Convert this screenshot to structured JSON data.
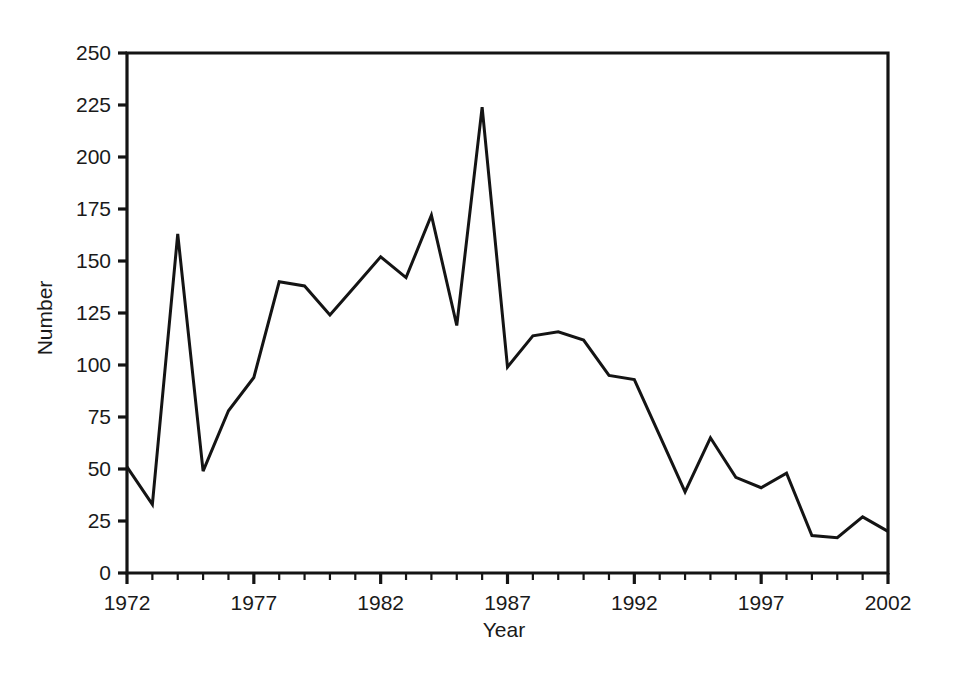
{
  "chart_data": {
    "type": "line",
    "title": "",
    "xlabel": "Year",
    "ylabel": "Number",
    "xlim": [
      1972,
      2002
    ],
    "ylim": [
      0,
      250
    ],
    "grid": false,
    "legend": null,
    "x_tick_labels": [
      "1972",
      "1977",
      "1982",
      "1987",
      "1992",
      "1997",
      "2002"
    ],
    "x_tick_values": [
      1972,
      1977,
      1982,
      1987,
      1992,
      1997,
      2002
    ],
    "x_minor_tick_interval": 1,
    "y_tick_labels": [
      "0",
      "25",
      "50",
      "75",
      "100",
      "125",
      "150",
      "175",
      "200",
      "225",
      "250"
    ],
    "y_tick_values": [
      0,
      25,
      50,
      75,
      100,
      125,
      150,
      175,
      200,
      225,
      250
    ],
    "x": [
      1972,
      1973,
      1974,
      1975,
      1976,
      1977,
      1978,
      1979,
      1980,
      1981,
      1982,
      1983,
      1984,
      1985,
      1986,
      1987,
      1988,
      1989,
      1990,
      1991,
      1992,
      1993,
      1994,
      1995,
      1996,
      1997,
      1998,
      1999,
      2000,
      2001,
      2002
    ],
    "values": [
      51,
      33,
      163,
      49,
      78,
      94,
      140,
      138,
      124,
      138,
      152,
      142,
      172,
      119,
      224,
      99,
      114,
      116,
      112,
      95,
      93,
      66,
      39,
      65,
      46,
      41,
      48,
      18,
      17,
      27,
      20
    ],
    "series": [
      {
        "name": "Number",
        "color": "#141414",
        "values": [
          51,
          33,
          163,
          49,
          78,
          94,
          140,
          138,
          124,
          138,
          152,
          142,
          172,
          119,
          224,
          99,
          114,
          116,
          112,
          95,
          93,
          66,
          39,
          65,
          46,
          41,
          48,
          18,
          17,
          27,
          20
        ]
      }
    ],
    "annotations": []
  },
  "style": {
    "line_color": "#141414",
    "axis_color": "#141414",
    "background": "#ffffff",
    "text_color": "#1a1a1a"
  }
}
